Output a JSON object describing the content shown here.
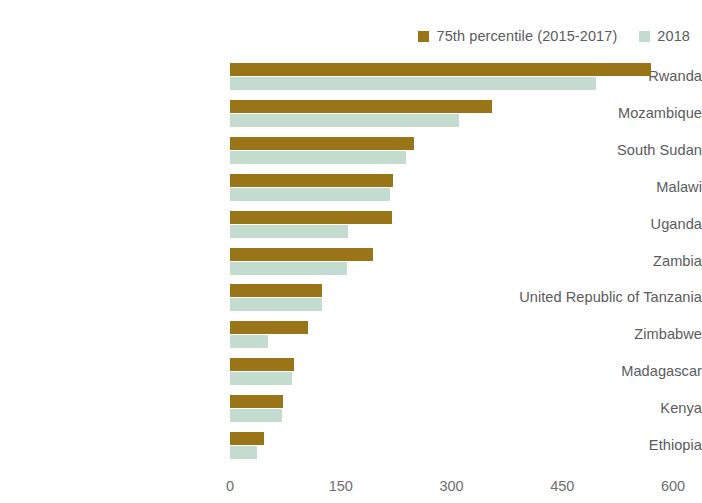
{
  "chart_data": {
    "type": "bar",
    "orientation": "horizontal",
    "title": "",
    "subtitle": "",
    "xlabel": "",
    "ylabel": "",
    "xlim": [
      0,
      600
    ],
    "xticks": [
      "0",
      "150",
      "300",
      "450",
      "600"
    ],
    "grid": false,
    "legend_position": "top-right",
    "categories": [
      "Rwanda",
      "Mozambique",
      "South Sudan",
      "Malawi",
      "Uganda",
      "Zambia",
      "United Republic of Tanzania",
      "Zimbabwe",
      "Madagascar",
      "Kenya",
      "Ethiopia"
    ],
    "series": [
      {
        "name": "75th percentile (2015-2017)",
        "color": "#9a7518",
        "values": [
          570,
          355,
          249,
          221,
          220,
          194,
          125,
          105,
          87,
          72,
          46
        ]
      },
      {
        "name": "2018",
        "color": "#c4dcd0",
        "values": [
          496,
          310,
          239,
          217,
          160,
          158,
          125,
          52,
          84,
          70,
          36
        ]
      }
    ]
  },
  "legend": {
    "entries": [
      {
        "label": "75th percentile (2015-2017)",
        "color": "#9a7518"
      },
      {
        "label": "2018",
        "color": "#c4dcd0"
      }
    ]
  }
}
